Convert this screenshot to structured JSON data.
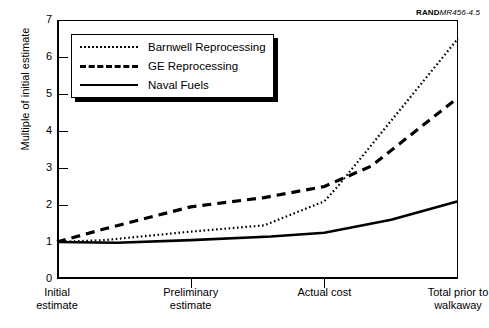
{
  "figure": {
    "source_tag_bold": "RAND",
    "source_tag_rest": "MR456-4.5"
  },
  "chart_data": {
    "type": "line",
    "title": "",
    "xlabel": "",
    "ylabel": "Multiple of initial estimate",
    "ylim": [
      0,
      7
    ],
    "yticks": [
      0,
      1,
      2,
      3,
      4,
      5,
      6,
      7
    ],
    "ytick_labels": [
      "0",
      "1",
      "2",
      "3",
      "4",
      "5",
      "6",
      "7"
    ],
    "grid": false,
    "legend_position": "upper-left-inside",
    "categories": [
      "Initial\nestimate",
      "Preliminary\nestimate",
      "Actual cost",
      "Total prior to\nwalkaway"
    ],
    "x": [
      0,
      1,
      2,
      3
    ],
    "series": [
      {
        "name": "Barnwell Reprocessing",
        "style": "dotted",
        "color": "#000000",
        "values": [
          1.0,
          1.28,
          2.1,
          6.5
        ],
        "points": [
          {
            "x": 0.0,
            "y": 1.0
          },
          {
            "x": 0.35,
            "y": 1.05
          },
          {
            "x": 1.0,
            "y": 1.28
          },
          {
            "x": 1.55,
            "y": 1.45
          },
          {
            "x": 2.0,
            "y": 2.1
          },
          {
            "x": 2.1,
            "y": 2.5
          },
          {
            "x": 3.0,
            "y": 6.5
          }
        ]
      },
      {
        "name": "GE Reprocessing",
        "style": "dashed",
        "color": "#000000",
        "values": [
          1.0,
          1.95,
          2.5,
          4.9
        ],
        "points": [
          {
            "x": 0.0,
            "y": 1.0
          },
          {
            "x": 0.35,
            "y": 1.35
          },
          {
            "x": 1.0,
            "y": 1.95
          },
          {
            "x": 1.55,
            "y": 2.2
          },
          {
            "x": 2.0,
            "y": 2.5
          },
          {
            "x": 2.35,
            "y": 3.05
          },
          {
            "x": 3.0,
            "y": 4.9
          }
        ]
      },
      {
        "name": "Naval Fuels",
        "style": "solid",
        "color": "#000000",
        "values": [
          1.0,
          1.05,
          1.25,
          2.1
        ],
        "points": [
          {
            "x": 0.0,
            "y": 1.0
          },
          {
            "x": 0.45,
            "y": 0.98
          },
          {
            "x": 1.0,
            "y": 1.05
          },
          {
            "x": 1.6,
            "y": 1.15
          },
          {
            "x": 2.0,
            "y": 1.25
          },
          {
            "x": 2.5,
            "y": 1.6
          },
          {
            "x": 3.0,
            "y": 2.1
          }
        ]
      }
    ]
  }
}
